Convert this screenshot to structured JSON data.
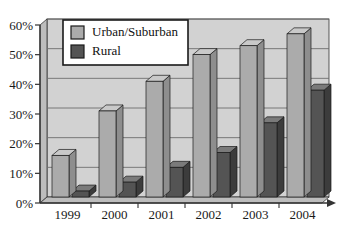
{
  "chart_data": {
    "type": "bar",
    "title": "",
    "subtitle": "",
    "xlabel": "",
    "ylabel": "",
    "categories": [
      "1999",
      "2000",
      "2001",
      "2002",
      "2003",
      "2004"
    ],
    "series": [
      {
        "name": "Urban/Suburban",
        "values": [
          14,
          29,
          39,
          48,
          51,
          55
        ],
        "color": "#ababab"
      },
      {
        "name": "Rural",
        "values": [
          2,
          5,
          10,
          15,
          25,
          36
        ],
        "color": "#545454"
      }
    ],
    "ylim": [
      0,
      60
    ],
    "ytick_labels": [
      "0%",
      "10%",
      "20%",
      "30%",
      "40%",
      "50%",
      "60%"
    ],
    "ytick_values": [
      0,
      10,
      20,
      30,
      40,
      50,
      60
    ],
    "grid": true,
    "legend_position": "top-left-inside",
    "style": "3d-column",
    "units": "percent"
  },
  "colors": {
    "plot_background": "#d2d2d2",
    "gridline": "#6e6e6e",
    "axis_line": "#333333",
    "urban_face": "#ababab",
    "urban_top": "#c9c9c9",
    "urban_side": "#8e8e8e",
    "rural_face": "#545454",
    "rural_top": "#7a7a7a",
    "rural_side": "#3c3c3c",
    "wall_side": "#bdbdbd",
    "legend_background": "#ffffff",
    "legend_border": "#1a1a1a",
    "text": "#111111"
  }
}
